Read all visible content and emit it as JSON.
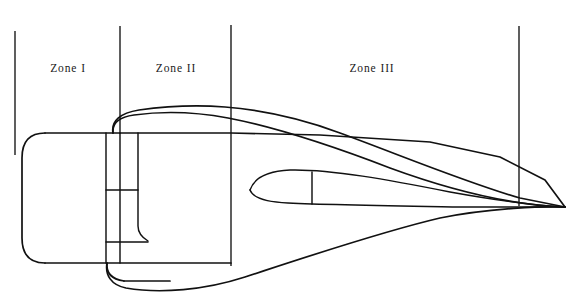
{
  "figure": {
    "background_color": "#ffffff",
    "stroke_color": "#111111",
    "width": 579,
    "height": 304,
    "zones": [
      {
        "id": "zone-1",
        "label": "Zone I",
        "center_x": 68,
        "center_y": 68
      },
      {
        "id": "zone-2",
        "label": "Zone II",
        "center_x": 176,
        "center_y": 68
      },
      {
        "id": "zone-3",
        "label": "Zone III",
        "center_x": 372,
        "center_y": 68
      }
    ],
    "reference_lines": [
      {
        "id": "ref-line-1",
        "x": 15,
        "y_top": 31,
        "y_bottom": 155
      },
      {
        "id": "ref-line-2",
        "x": 120,
        "y_top": 26,
        "y_bottom": 134
      },
      {
        "id": "ref-line-3",
        "x": 231,
        "y_top": 25,
        "y_bottom": 266
      },
      {
        "id": "ref-line-4",
        "x": 519,
        "y_top": 26,
        "y_bottom": 206
      }
    ],
    "geometry": {
      "cowl_upper_label": "cowl-upper-contour",
      "cowl_lower_label": "cowl-lower-contour",
      "body_label": "forebody-outline",
      "centerbody_label": "centerbody-spike",
      "shock_label": "shock-line",
      "skirt_label": "aft-skirt",
      "strut_label": "strut-assembly",
      "apex_x": 565,
      "apex_y": 207
    }
  }
}
